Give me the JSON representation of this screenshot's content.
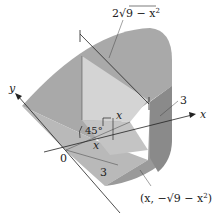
{
  "figure": {
    "labels": {
      "chord_length": "2√(9 − x²)",
      "chord_coef": "2",
      "chord_radicand": "9 − x",
      "chord_exp": "2",
      "y_axis": "y",
      "x_axis": "x",
      "origin": "0",
      "angle": "45°",
      "height_x": "x",
      "base_x": "x",
      "radius_bottom": "3",
      "radius_right": "3",
      "point_prefix": "(x, −",
      "point_radicand": "9 − x",
      "point_exp": "2",
      "point_suffix": ")"
    },
    "colors": {
      "surface_top": "#a8a8a8",
      "surface_light": "#c9c9c9",
      "surface_mid": "#b8b8b8",
      "surface_dark": "#8e8e8e",
      "section_face": "#d6d6d6",
      "line": "#222222"
    }
  }
}
